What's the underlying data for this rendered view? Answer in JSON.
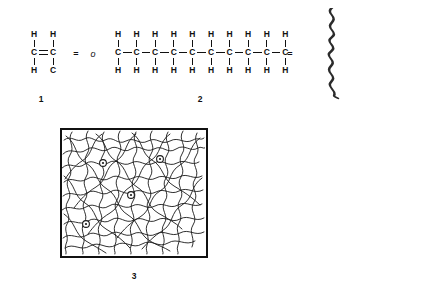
{
  "figure": {
    "background_color": "#ffffff",
    "ink_color": "#111111"
  },
  "structure_1": {
    "label": "1",
    "name": "ethylene-monomer",
    "description": "Ethylene monomer unit with carbon-carbon double bond",
    "atoms": {
      "top_left_h": "H",
      "top_right_h": "H",
      "left_c": "C",
      "right_c": "C",
      "bottom_left_h": "H",
      "bottom_right_c": "C"
    },
    "bond_between_carbons": "double",
    "equals_sign": "=",
    "repeat_unit_glyph": "o"
  },
  "structure_2": {
    "label": "2",
    "name": "polyethylene-chain",
    "description": "Extended polyethylene backbone, ten carbon atoms each bearing two hydrogens",
    "carbon_count": 10,
    "carbon_symbol": "C",
    "hydrogen_symbol": "H",
    "top_hydrogens": [
      "H",
      "H",
      "H",
      "H",
      "H",
      "H",
      "H",
      "H",
      "H",
      "H"
    ],
    "carbons": [
      "C",
      "C",
      "C",
      "C",
      "C",
      "C",
      "C",
      "C",
      "C",
      "C"
    ],
    "bottom_hydrogens": [
      "H",
      "H",
      "H",
      "H",
      "H",
      "H",
      "H",
      "H",
      "H",
      "H"
    ],
    "equals_sign": "=",
    "chain_representation": "wavy-line"
  },
  "structure_3": {
    "label": "3",
    "name": "entangled-polymer-network",
    "description": "Box containing randomly coiled and entangled polymer chains with crosslink markers",
    "crosslink_marker_count": 4,
    "box_border_color": "#111111",
    "chain_color": "#1a1a1a"
  }
}
